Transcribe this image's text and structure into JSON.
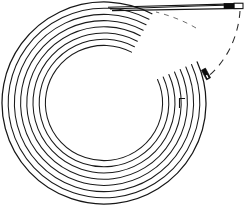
{
  "figure": {
    "name": "coiled-tubing-line-drawing",
    "background_color": "#ffffff",
    "line_color": "#1a1a1a",
    "accent_color": "#0d0d0d",
    "width": 248,
    "height": 208
  },
  "coil": {
    "label": "coiled-tube-body",
    "center_x": 104,
    "center_y": 103,
    "outer_radius_x": 102,
    "outer_radius_y": 101,
    "turn_count": 8,
    "turn_spacing": 6.2,
    "stroke_width": 1.05,
    "turn_radii_x": [
      102,
      95.8,
      89.6,
      83.4,
      77.2,
      71.0,
      64.8,
      58.6
    ],
    "turn_radii_y": [
      101,
      94.8,
      88.6,
      82.4,
      76.2,
      70.0,
      63.8,
      57.6
    ]
  },
  "lead_tube": {
    "label": "straight-lead-tube",
    "start_x": 108,
    "start_y": 8,
    "end_x": 243,
    "end_y": 5,
    "thickness": 3.4,
    "top_edge_y": 4,
    "bottom_edge_y": 8
  },
  "ferrule": {
    "label": "ferrule-band",
    "x": 224,
    "y": 3.4,
    "width": 10,
    "height": 5.2,
    "color": "#0d0d0d"
  },
  "tip": {
    "label": "tube-tip-segment",
    "x": 234,
    "y": 3.4,
    "width": 9,
    "height": 5.2,
    "color": "#ffffff"
  },
  "connector": {
    "label": "outer-coil-connector",
    "x": 206,
    "y": 70,
    "width": 4.6,
    "height": 11,
    "rotation_deg": -28,
    "color": "#0b0b0b"
  },
  "notch": {
    "label": "inner-coil-notch",
    "x": 179,
    "y": 103,
    "length": 9,
    "arm": 5
  },
  "guides": [
    {
      "label": "dashed-outfeed-guide",
      "style": "dashed",
      "dash_pattern": "7 6"
    },
    {
      "label": "dashed-inner-arc-guide",
      "style": "dashed-faint",
      "dash_pattern": "5 5"
    }
  ]
}
